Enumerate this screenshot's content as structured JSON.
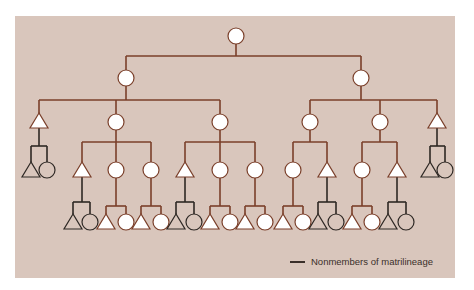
{
  "diagram": {
    "type": "kinship-chart",
    "subject": "matrilineage",
    "colors": {
      "background": "#d9c6bc",
      "member_line": "#7a3f2a",
      "nonmember_line": "#2e2824",
      "member_fill": "#ffffff",
      "nonmember_fill": "none"
    },
    "symbols": {
      "circle": "female",
      "triangle": "male"
    },
    "generations": 5,
    "nodes": [
      {
        "id": "g1",
        "shape": "circle",
        "x": 236,
        "y": 36,
        "member": true
      },
      {
        "id": "g2a",
        "shape": "circle",
        "x": 126,
        "y": 78,
        "member": true
      },
      {
        "id": "g2b",
        "shape": "circle",
        "x": 361,
        "y": 78,
        "member": true
      },
      {
        "id": "g3a",
        "shape": "triangle",
        "x": 39,
        "y": 121,
        "member": true
      },
      {
        "id": "g3b",
        "shape": "circle",
        "x": 116,
        "y": 122,
        "member": true
      },
      {
        "id": "g3c",
        "shape": "circle",
        "x": 220,
        "y": 122,
        "member": true
      },
      {
        "id": "g3d",
        "shape": "circle",
        "x": 310,
        "y": 122,
        "member": true
      },
      {
        "id": "g3e",
        "shape": "circle",
        "x": 380,
        "y": 122,
        "member": true
      },
      {
        "id": "g3f",
        "shape": "triangle",
        "x": 437,
        "y": 121,
        "member": true
      },
      {
        "id": "g4a1",
        "shape": "triangle",
        "x": 31,
        "y": 170,
        "member": false
      },
      {
        "id": "g4a2",
        "shape": "circle",
        "x": 47,
        "y": 170,
        "member": false
      },
      {
        "id": "g4b1",
        "shape": "triangle",
        "x": 82,
        "y": 170,
        "member": true
      },
      {
        "id": "g4b2",
        "shape": "circle",
        "x": 116,
        "y": 170,
        "member": true
      },
      {
        "id": "g4b3",
        "shape": "circle",
        "x": 151,
        "y": 170,
        "member": true
      },
      {
        "id": "g4c1",
        "shape": "triangle",
        "x": 185,
        "y": 170,
        "member": true
      },
      {
        "id": "g4c2",
        "shape": "circle",
        "x": 220,
        "y": 170,
        "member": true
      },
      {
        "id": "g4c3",
        "shape": "circle",
        "x": 255,
        "y": 170,
        "member": true
      },
      {
        "id": "g4d1",
        "shape": "circle",
        "x": 293,
        "y": 170,
        "member": true
      },
      {
        "id": "g4d2",
        "shape": "triangle",
        "x": 327,
        "y": 170,
        "member": true
      },
      {
        "id": "g4e1",
        "shape": "circle",
        "x": 362,
        "y": 170,
        "member": true
      },
      {
        "id": "g4e2",
        "shape": "triangle",
        "x": 397,
        "y": 170,
        "member": true
      },
      {
        "id": "g4f1",
        "shape": "triangle",
        "x": 430,
        "y": 170,
        "member": false
      },
      {
        "id": "g4f2",
        "shape": "circle",
        "x": 445,
        "y": 170,
        "member": false
      }
    ]
  },
  "legend": {
    "items": [
      {
        "swatch": "line",
        "color": "#2e2824",
        "label": "Nonmembers of matrilineage"
      }
    ]
  }
}
